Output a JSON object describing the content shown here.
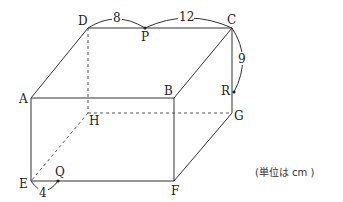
{
  "figure": {
    "type": "rectangular-prism",
    "vertices": {
      "A": {
        "label": "A",
        "x": 31,
        "y": 98
      },
      "B": {
        "label": "B",
        "x": 174,
        "y": 98
      },
      "C": {
        "label": "C",
        "x": 232,
        "y": 28
      },
      "D": {
        "label": "D",
        "x": 88,
        "y": 28
      },
      "E": {
        "label": "E",
        "x": 31,
        "y": 181
      },
      "F": {
        "label": "F",
        "x": 174,
        "y": 181
      },
      "G": {
        "label": "G",
        "x": 232,
        "y": 113
      },
      "H": {
        "label": "H",
        "x": 88,
        "y": 113
      }
    },
    "points": {
      "P": {
        "label": "P",
        "on_edge": "DC"
      },
      "Q": {
        "label": "Q",
        "on_edge": "EF"
      },
      "R": {
        "label": "R",
        "on_edge": "CG"
      }
    },
    "measurements": {
      "DP": "8",
      "PC": "12",
      "CR": "9",
      "EQ": "4"
    },
    "hidden_edges": [
      "DH",
      "HE",
      "HG"
    ],
    "unit_note": "(単位は cm )"
  }
}
